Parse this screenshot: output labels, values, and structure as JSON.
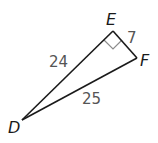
{
  "diagram": {
    "type": "right-triangle",
    "vertices": {
      "D": {
        "label": "D",
        "x": 22,
        "y": 120
      },
      "E": {
        "label": "E",
        "x": 113,
        "y": 31
      },
      "F": {
        "label": "F",
        "x": 137,
        "y": 58
      }
    },
    "sides": {
      "DE": {
        "label": "24"
      },
      "EF": {
        "label": "7"
      },
      "DF": {
        "label": "25"
      }
    },
    "right_angle_at": "E",
    "colors": {
      "stroke": "#1a1a1a",
      "right_angle_marker": "#8c8c8c",
      "side_label": "#555555"
    }
  }
}
